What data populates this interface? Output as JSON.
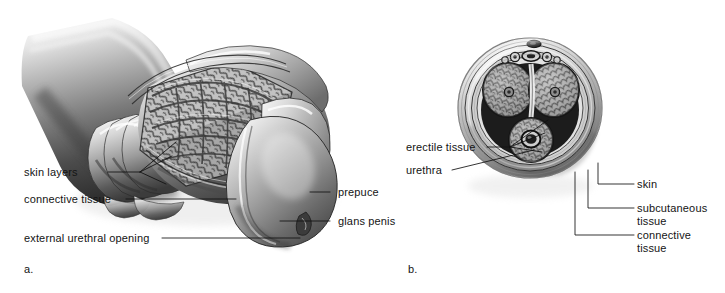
{
  "figure": {
    "background_color": "#ffffff",
    "ink_color": "#141414",
    "style": "grayscale medical illustration, airbrush shaded, thin black leader lines"
  },
  "panels": [
    {
      "id": "a",
      "letter": "a.",
      "caption": "longitudinal cutaway view of the penis shaft and glans",
      "labels": [
        {
          "key": "skin_layers",
          "text": "skin layers",
          "align": "right",
          "leader": "fan-3"
        },
        {
          "key": "connective_tissue",
          "text": "connective tissue",
          "align": "right",
          "leader": "straight"
        },
        {
          "key": "external_urethral_opening",
          "text": "external urethral opening",
          "align": "right",
          "leader": "straight"
        },
        {
          "key": "prepuce",
          "text": "prepuce",
          "align": "left",
          "leader": "straight"
        },
        {
          "key": "glans_penis",
          "text": "glans penis",
          "align": "left",
          "leader": "straight"
        }
      ]
    },
    {
      "id": "b",
      "letter": "b.",
      "caption": "transverse cross-section through the penile shaft",
      "labels": [
        {
          "key": "erectile_tissue",
          "text": "erectile tissue",
          "align": "right",
          "leader": "fan-3"
        },
        {
          "key": "urethra",
          "text": "urethra",
          "align": "right",
          "leader": "straight"
        },
        {
          "key": "skin",
          "text": "skin",
          "align": "left",
          "leader": "elbow"
        },
        {
          "key": "subcutaneous_tissue",
          "text": "subcutaneous\ntissue",
          "align": "left",
          "leader": "elbow"
        },
        {
          "key": "connective_tissue_b",
          "text": "connective\ntissue",
          "align": "left",
          "leader": "elbow"
        }
      ]
    }
  ],
  "palette": {
    "paper": "#ffffff",
    "tissue_light": "#e3e3e3",
    "tissue_mid": "#a9a9a9",
    "tissue_dark": "#5e5e5e",
    "tissue_deep": "#2f2f2f",
    "outline": "#111111"
  }
}
